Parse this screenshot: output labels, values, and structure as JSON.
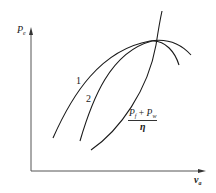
{
  "diagram": {
    "type": "qualitative-curve-plot",
    "y_axis": {
      "symbol": "P",
      "subscript": "e"
    },
    "x_axis": {
      "symbol": "v",
      "subscript": "a"
    },
    "curves": [
      {
        "id": "curve-1",
        "label": "1"
      },
      {
        "id": "curve-2",
        "label": "2"
      },
      {
        "id": "resistance-power-curve",
        "label_numerator": "P",
        "num_sub1": "f",
        "plus": " + ",
        "num_sub2": "w",
        "label_numerator_2": "P",
        "label_denominator": "η"
      }
    ],
    "colors": {
      "line": "#1a1a1a",
      "axis": "#444444",
      "background": "#ffffff"
    }
  }
}
